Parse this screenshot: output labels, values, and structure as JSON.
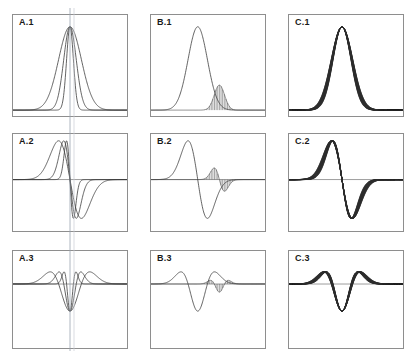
{
  "figure": {
    "title": "",
    "background_color": "#ffffff",
    "frame_color": "#8e8e8e",
    "curve_color": "#3a3a3a",
    "band_color": "#2b2b2b",
    "guide_color": "#9aa3b0",
    "rows": 3,
    "columns": 3
  },
  "panels": [
    {
      "id": "A1",
      "label": "A.1",
      "column": "A",
      "row": 1,
      "order": "zeroth",
      "style": "overlaid-widths",
      "x": 12,
      "y": 14,
      "w": 116,
      "h": 103,
      "has_vertical_guide": true,
      "has_zero_line": false
    },
    {
      "id": "B1",
      "label": "B.1",
      "column": "B",
      "row": 1,
      "order": "zeroth",
      "style": "main-plus-hatched",
      "x": 150,
      "y": 14,
      "w": 116,
      "h": 103,
      "has_vertical_guide": false,
      "has_zero_line": false
    },
    {
      "id": "C1",
      "label": "C.1",
      "column": "C",
      "row": 1,
      "order": "zeroth",
      "style": "dark-envelope-band",
      "x": 288,
      "y": 14,
      "w": 116,
      "h": 103,
      "has_vertical_guide": false,
      "has_zero_line": false
    },
    {
      "id": "A2",
      "label": "A.2",
      "column": "A",
      "row": 2,
      "order": "first",
      "style": "overlaid-widths",
      "x": 12,
      "y": 133,
      "w": 116,
      "h": 99,
      "has_vertical_guide": true,
      "has_zero_line": true
    },
    {
      "id": "B2",
      "label": "B.2",
      "column": "B",
      "row": 2,
      "order": "first",
      "style": "main-plus-hatched",
      "x": 150,
      "y": 133,
      "w": 116,
      "h": 99,
      "has_vertical_guide": false,
      "has_zero_line": true
    },
    {
      "id": "C2",
      "label": "C.2",
      "column": "C",
      "row": 2,
      "order": "first",
      "style": "dark-envelope-band",
      "x": 288,
      "y": 133,
      "w": 116,
      "h": 99,
      "has_vertical_guide": false,
      "has_zero_line": true
    },
    {
      "id": "A3",
      "label": "A.3",
      "column": "A",
      "row": 3,
      "order": "second",
      "style": "overlaid-widths",
      "x": 12,
      "y": 250,
      "w": 116,
      "h": 99,
      "has_vertical_guide": true,
      "has_zero_line": true
    },
    {
      "id": "B3",
      "label": "B.3",
      "column": "B",
      "row": 3,
      "order": "second",
      "style": "main-plus-hatched",
      "x": 150,
      "y": 250,
      "w": 116,
      "h": 99,
      "has_vertical_guide": false,
      "has_zero_line": true
    },
    {
      "id": "C3",
      "label": "C.3",
      "column": "C",
      "row": 3,
      "order": "second",
      "style": "dark-envelope-band",
      "x": 288,
      "y": 250,
      "w": 116,
      "h": 99,
      "has_vertical_guide": false,
      "has_zero_line": true
    }
  ],
  "chart_data": {
    "type": "line",
    "title": "",
    "xlabel": "",
    "ylabel": "",
    "grid": false,
    "legend": "none",
    "xlim": [
      -5,
      5
    ],
    "ylim_row1": [
      0,
      1.05
    ],
    "ylim_row2": [
      -1.05,
      1.05
    ],
    "ylim_row3": [
      -1.05,
      1.05
    ],
    "function_family": "gaussian",
    "derivative_orders": [
      0,
      1,
      2
    ],
    "columns": {
      "A": {
        "description": "Several Gaussians of different widths overlaid, all centered at x=0, normalized to equal peak height; a faint vertical guide line at x=0 spans all three A panels",
        "center": 0.0,
        "sigmas": [
          0.3,
          0.55,
          1.0
        ],
        "amplitudes": [
          1.0,
          1.0,
          1.0
        ],
        "line_width": 0.8
      },
      "B": {
        "description": "One broad main Gaussian plus a narrower secondary Gaussian drawn as dense vertical hatching, offset to the right and smaller in amplitude",
        "main": {
          "center": -0.9,
          "sigma": 0.85,
          "amplitude": 1.0
        },
        "hatched": {
          "center": 1.0,
          "sigma": 0.45,
          "amplitude": 0.3,
          "hatch_lines": 70
        },
        "line_width": 0.8
      },
      "C": {
        "description": "A family of closely spaced Gaussians of progressively shifting width forming a thick dark envelope band on the falling flank",
        "center": -0.35,
        "sigma_start": 0.78,
        "sigma_end": 0.95,
        "band_curves": 26,
        "amplitude": 1.0,
        "line_width": 0.7
      }
    },
    "series": [
      {
        "name": "A.1 narrow",
        "panel": "A1",
        "order": 0,
        "sigma": 0.3,
        "center": 0.0
      },
      {
        "name": "A.1 medium",
        "panel": "A1",
        "order": 0,
        "sigma": 0.55,
        "center": 0.0
      },
      {
        "name": "A.1 broad",
        "panel": "A1",
        "order": 0,
        "sigma": 1.0,
        "center": 0.0
      },
      {
        "name": "B.1 main",
        "panel": "B1",
        "order": 0,
        "sigma": 0.85,
        "center": -0.9,
        "amplitude": 1.0
      },
      {
        "name": "B.1 hatched",
        "panel": "B1",
        "order": 0,
        "sigma": 0.45,
        "center": 1.0,
        "amplitude": 0.3
      },
      {
        "name": "C.1 band",
        "panel": "C1",
        "order": 0,
        "sigma": 0.86,
        "center": -0.35
      },
      {
        "name": "A.2 narrow",
        "panel": "A2",
        "order": 1,
        "sigma": 0.3,
        "center": 0.0
      },
      {
        "name": "A.2 medium",
        "panel": "A2",
        "order": 1,
        "sigma": 0.55,
        "center": 0.0
      },
      {
        "name": "A.2 broad",
        "panel": "A2",
        "order": 1,
        "sigma": 1.0,
        "center": 0.0
      },
      {
        "name": "B.2 main",
        "panel": "B2",
        "order": 1,
        "sigma": 0.85,
        "center": -0.9,
        "amplitude": 1.0
      },
      {
        "name": "B.2 hatched",
        "panel": "B2",
        "order": 1,
        "sigma": 0.45,
        "center": 1.0,
        "amplitude": 0.32
      },
      {
        "name": "C.2 band",
        "panel": "C2",
        "order": 1,
        "sigma": 0.86,
        "center": -0.35
      },
      {
        "name": "A.3 narrow",
        "panel": "A3",
        "order": 2,
        "sigma": 0.3,
        "center": 0.0
      },
      {
        "name": "A.3 medium",
        "panel": "A3",
        "order": 2,
        "sigma": 0.55,
        "center": 0.0
      },
      {
        "name": "A.3 broad",
        "panel": "A3",
        "order": 2,
        "sigma": 1.0,
        "center": 0.0
      },
      {
        "name": "B.3 main",
        "panel": "B3",
        "order": 2,
        "sigma": 0.85,
        "center": -0.9,
        "amplitude": 1.0
      },
      {
        "name": "B.3 hatched",
        "panel": "B3",
        "order": 2,
        "sigma": 0.45,
        "center": 1.0,
        "amplitude": 0.34
      },
      {
        "name": "C.3 band",
        "panel": "C3",
        "order": 2,
        "sigma": 0.86,
        "center": -0.35
      }
    ]
  }
}
